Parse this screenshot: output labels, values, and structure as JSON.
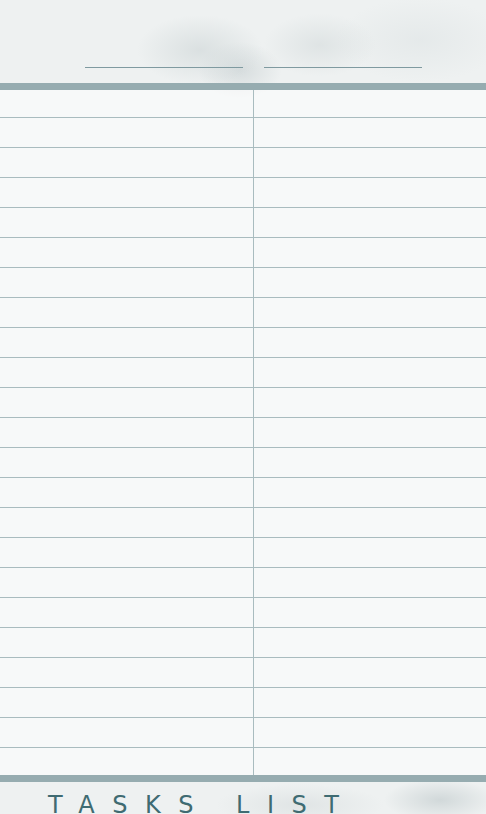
{
  "header": {
    "field_left": "",
    "field_right": ""
  },
  "table": {
    "row_count": 23,
    "rows": [
      {
        "left": "",
        "right": ""
      },
      {
        "left": "",
        "right": ""
      },
      {
        "left": "",
        "right": ""
      },
      {
        "left": "",
        "right": ""
      },
      {
        "left": "",
        "right": ""
      },
      {
        "left": "",
        "right": ""
      },
      {
        "left": "",
        "right": ""
      },
      {
        "left": "",
        "right": ""
      },
      {
        "left": "",
        "right": ""
      },
      {
        "left": "",
        "right": ""
      },
      {
        "left": "",
        "right": ""
      },
      {
        "left": "",
        "right": ""
      },
      {
        "left": "",
        "right": ""
      },
      {
        "left": "",
        "right": ""
      },
      {
        "left": "",
        "right": ""
      },
      {
        "left": "",
        "right": ""
      },
      {
        "left": "",
        "right": ""
      },
      {
        "left": "",
        "right": ""
      },
      {
        "left": "",
        "right": ""
      },
      {
        "left": "",
        "right": ""
      },
      {
        "left": "",
        "right": ""
      },
      {
        "left": "",
        "right": ""
      },
      {
        "left": "",
        "right": ""
      }
    ]
  },
  "footer": {
    "title": "TASKS LIST"
  },
  "colors": {
    "band": "#96acb0",
    "rule": "#a9bcbf",
    "title_text": "#3f6b72"
  }
}
